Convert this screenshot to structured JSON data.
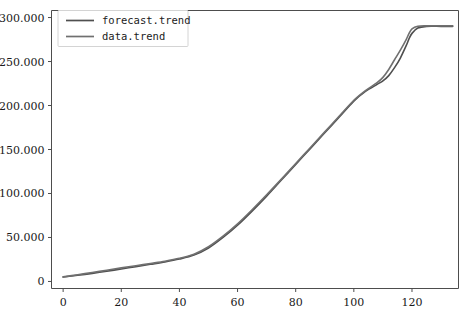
{
  "chart_data": {
    "type": "line",
    "title": "",
    "xlabel": "",
    "ylabel": "",
    "xlim": [
      -4,
      136
    ],
    "ylim": [
      -8000,
      308000
    ],
    "xticks": [
      0,
      20,
      40,
      60,
      80,
      100,
      120
    ],
    "xticklabels": [
      "0",
      "20",
      "40",
      "60",
      "80",
      "100",
      "120"
    ],
    "yticks": [
      0,
      50000,
      100000,
      150000,
      200000,
      250000,
      300000
    ],
    "yticklabels": [
      "0",
      "50.000",
      "100.000",
      "150.000",
      "200.000",
      "250.000",
      "300.000"
    ],
    "grid": false,
    "legend_position": "upper left",
    "series": [
      {
        "name": "forecast.trend",
        "color": "#4f4f4f",
        "x": [
          0,
          5,
          10,
          15,
          20,
          25,
          30,
          35,
          40,
          45,
          50,
          55,
          60,
          65,
          70,
          75,
          80,
          85,
          90,
          95,
          100,
          104,
          108,
          110,
          112,
          114,
          116,
          118,
          119,
          120,
          122,
          125,
          130,
          134
        ],
        "y": [
          5000,
          7000,
          9200,
          11600,
          14200,
          16800,
          19500,
          22200,
          25500,
          30000,
          38000,
          50000,
          64000,
          80000,
          97000,
          115000,
          133000,
          151000,
          169000,
          187000,
          205000,
          216000,
          224000,
          228000,
          234000,
          243000,
          254000,
          268000,
          276000,
          282000,
          288000,
          290000,
          290000,
          290000
        ]
      },
      {
        "name": "data.trend",
        "color": "#707070",
        "x": [
          0,
          5,
          10,
          15,
          20,
          25,
          30,
          35,
          40,
          45,
          50,
          55,
          60,
          65,
          70,
          75,
          80,
          85,
          90,
          95,
          100,
          104,
          108,
          110,
          112,
          114,
          116,
          118,
          119,
          120,
          122,
          125,
          130,
          134
        ],
        "y": [
          5200,
          7600,
          10200,
          12800,
          15400,
          17900,
          20400,
          23000,
          26300,
          31000,
          39500,
          51500,
          65500,
          81500,
          98500,
          116000,
          134000,
          152000,
          170000,
          188000,
          206000,
          217000,
          226000,
          232000,
          241000,
          252000,
          263000,
          275000,
          282000,
          287000,
          290000,
          290500,
          290500,
          290500
        ]
      }
    ]
  },
  "legend": {
    "entries": [
      {
        "label": "forecast.trend"
      },
      {
        "label": "data.trend"
      }
    ]
  },
  "caption": {
    "text": ""
  }
}
